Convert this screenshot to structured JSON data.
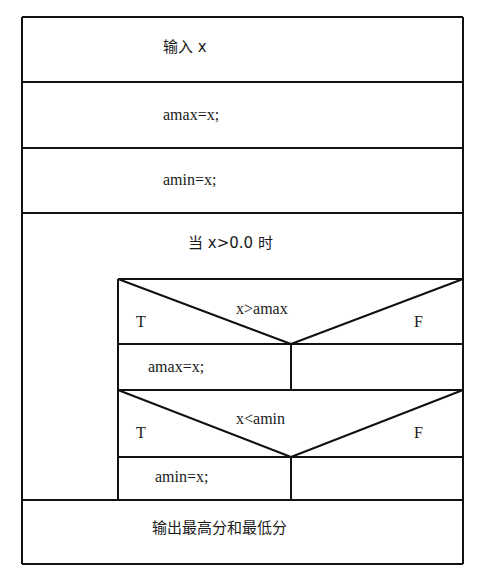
{
  "diagram": {
    "type": "N-S structured flowchart",
    "blocks": [
      {
        "id": "input",
        "text": "输入 x"
      },
      {
        "id": "init-max",
        "text": "amax=x;"
      },
      {
        "id": "init-min",
        "text": "amin=x;"
      },
      {
        "id": "loop",
        "condition": "当 x>0.0 时",
        "body": [
          {
            "id": "if-max",
            "condition": "x>amax",
            "true_label": "T",
            "false_label": "F",
            "true_branch": "amax=x;",
            "false_branch": ""
          },
          {
            "id": "if-min",
            "condition": "x<amin",
            "true_label": "T",
            "false_label": "F",
            "true_branch": "amin=x;",
            "false_branch": ""
          }
        ]
      },
      {
        "id": "output",
        "text": "输出最高分和最低分"
      }
    ]
  },
  "colors": {
    "line": "#111111",
    "background": "#ffffff"
  }
}
